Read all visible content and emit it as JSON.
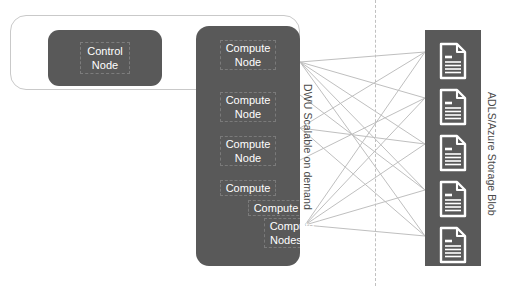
{
  "diagram": {
    "colors": {
      "node_fill": "#595959",
      "node_text": "#ffffff",
      "frame_border": "#c9c9c9",
      "divider": "#c0c0c0",
      "connector": "#bfbfbf",
      "label_text": "#4a4a4a",
      "background": "#ffffff"
    }
  },
  "control_group": {
    "frame_name": "control-group-frame",
    "control_node": {
      "label": "Control\nNode"
    }
  },
  "compute_group": {
    "vertical_label": "DWU Scalable on demand",
    "nodes": [
      {
        "label": "Compute\nNode",
        "top": 14,
        "align": "center",
        "indent": 0
      },
      {
        "label": "Compute\nNode",
        "top": 66,
        "align": "center",
        "indent": 0
      },
      {
        "label": "Compute\nNode",
        "top": 110,
        "align": "center",
        "indent": 0
      },
      {
        "label": "Compute",
        "top": 152,
        "align": "center",
        "indent": 0
      },
      {
        "label": "Compute",
        "top": 172,
        "align": "center",
        "indent": 14
      },
      {
        "label": "Compute\nNodes....",
        "top": 192,
        "align": "center",
        "indent": 22
      }
    ]
  },
  "storage_group": {
    "vertical_label": "ADLS/Azure Storage Blob",
    "documents": [
      {
        "icon": "document-icon",
        "top": 12
      },
      {
        "icon": "document-icon",
        "top": 58
      },
      {
        "icon": "document-icon",
        "top": 104
      },
      {
        "icon": "document-icon",
        "top": 150
      },
      {
        "icon": "document-icon",
        "top": 196
      }
    ]
  },
  "connectors": {
    "description": "Crossing lines from compute nodes to storage documents",
    "lines": [
      {
        "x1": 300,
        "y1": 62,
        "x2": 425,
        "y2": 52
      },
      {
        "x1": 300,
        "y1": 62,
        "x2": 425,
        "y2": 98
      },
      {
        "x1": 300,
        "y1": 62,
        "x2": 425,
        "y2": 144
      },
      {
        "x1": 300,
        "y1": 62,
        "x2": 425,
        "y2": 190
      },
      {
        "x1": 300,
        "y1": 62,
        "x2": 425,
        "y2": 236
      },
      {
        "x1": 300,
        "y1": 128,
        "x2": 425,
        "y2": 52
      },
      {
        "x1": 300,
        "y1": 128,
        "x2": 425,
        "y2": 144
      },
      {
        "x1": 300,
        "y1": 128,
        "x2": 425,
        "y2": 236
      },
      {
        "x1": 305,
        "y1": 225,
        "x2": 425,
        "y2": 52
      },
      {
        "x1": 305,
        "y1": 225,
        "x2": 425,
        "y2": 98
      },
      {
        "x1": 305,
        "y1": 225,
        "x2": 425,
        "y2": 144
      },
      {
        "x1": 305,
        "y1": 225,
        "x2": 425,
        "y2": 190
      },
      {
        "x1": 305,
        "y1": 225,
        "x2": 425,
        "y2": 236
      },
      {
        "x1": 300,
        "y1": 95,
        "x2": 425,
        "y2": 190
      },
      {
        "x1": 300,
        "y1": 160,
        "x2": 425,
        "y2": 98
      }
    ]
  }
}
